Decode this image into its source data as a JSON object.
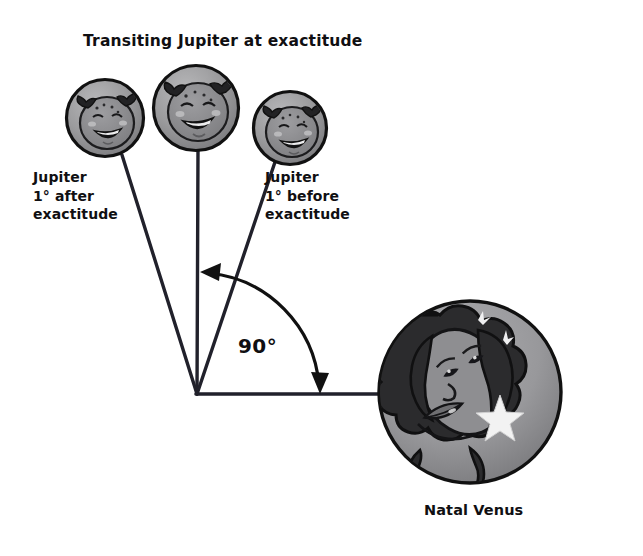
{
  "diagram": {
    "title": "Transiting Jupiter at exactitude",
    "labels": {
      "jupiter_after": "Jupiter\n1° after\nexactitude",
      "jupiter_before": "Jupiter\n1° before\nexactitude",
      "angle": "90°",
      "natal_venus": "Natal Venus"
    },
    "icons": {
      "jupiter_after_planet": "jupiter-laughing-face-icon",
      "jupiter_exact_planet": "jupiter-laughing-face-icon",
      "jupiter_before_planet": "jupiter-laughing-face-icon",
      "venus_planet": "venus-woman-face-icon",
      "angle_arc": "double-headed-arc-arrow-icon"
    },
    "colors": {
      "background": "#ffffff",
      "planet_disc": "#9a9a9c",
      "planet_disc_shade": "#7d7d80",
      "planet_highlight": "#c2c2c4",
      "face_tone": "#8a8a8d",
      "hair_dark": "#2a2a2c",
      "outline": "#111111",
      "line": "#21212b",
      "star": "#f2f2f2",
      "text": "#100f12"
    },
    "geometry": {
      "vertex": {
        "x": 197,
        "y": 394
      },
      "angle_degrees": 90,
      "venus_circle": {
        "cx": 470,
        "cy": 392,
        "r": 92
      },
      "jupiter_circles": [
        {
          "name": "jupiter-after-exactitude",
          "cx": 105,
          "cy": 118,
          "r": 39
        },
        {
          "name": "jupiter-at-exactitude",
          "cx": 196,
          "cy": 108,
          "r": 43
        },
        {
          "name": "jupiter-before-exactitude",
          "cx": 290,
          "cy": 128,
          "r": 37
        }
      ],
      "arc_radius": 123,
      "arrow_head_upper": {
        "x": 205,
        "y": 272
      },
      "arrow_head_lower": {
        "x": 320,
        "y": 392
      }
    }
  }
}
